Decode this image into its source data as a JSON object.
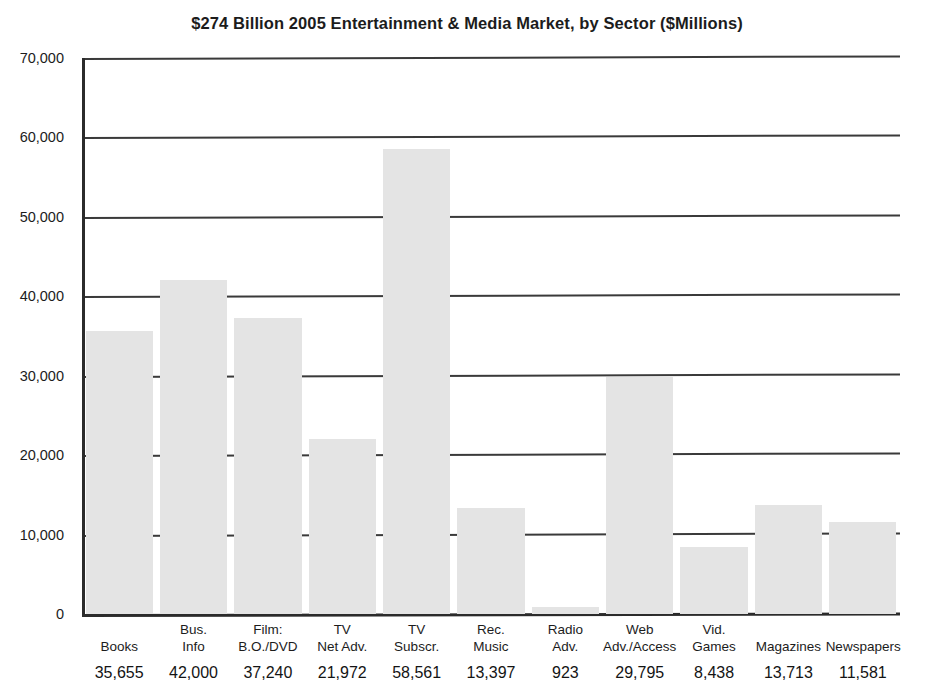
{
  "chart_data": {
    "type": "bar",
    "title": "$274 Billion 2005 Entertainment & Media Market, by Sector ($Millions)",
    "xlabel": "",
    "ylabel": "",
    "ylim": [
      0,
      70000
    ],
    "grid": true,
    "legend": "none",
    "y_ticks": [
      0,
      10000,
      20000,
      30000,
      40000,
      50000,
      60000,
      70000
    ],
    "y_tick_labels": [
      "0",
      "10,000",
      "20,000",
      "30,000",
      "40,000",
      "50,000",
      "60,000",
      "70,000"
    ],
    "categories": [
      "Books",
      "Bus. Info",
      "Film: B.O./DVD",
      "TV Net Adv.",
      "TV Subscr.",
      "Rec. Music",
      "Radio Adv.",
      "Web Adv./Access",
      "Vid. Games",
      "Magazines",
      "Newspapers"
    ],
    "category_lines": [
      [
        "",
        "Books"
      ],
      [
        "Bus.",
        "Info"
      ],
      [
        "Film:",
        "B.O./DVD"
      ],
      [
        "TV",
        "Net Adv."
      ],
      [
        "TV",
        "Subscr."
      ],
      [
        "Rec.",
        "Music"
      ],
      [
        "Radio",
        "Adv."
      ],
      [
        "Web",
        "Adv./Access"
      ],
      [
        "Vid.",
        "Games"
      ],
      [
        "",
        "Magazines"
      ],
      [
        "",
        "Newspapers"
      ]
    ],
    "values": [
      35655,
      42000,
      37240,
      21972,
      58561,
      13397,
      923,
      29795,
      8438,
      13713,
      11581
    ],
    "value_labels": [
      "35,655",
      "42,000",
      "37,240",
      "21,972",
      "58,561",
      "13,397",
      "923",
      "29,795",
      "8,438",
      "13,713",
      "11,581"
    ],
    "bar_color": "#e4e4e4",
    "axis_color": "#2b2b2b",
    "gridline_color": "#3a3a3a"
  }
}
